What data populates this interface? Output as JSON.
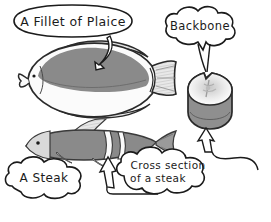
{
  "diagram": {
    "background_color": "#ffffff",
    "ink_color": "#1b1b1b",
    "body_gray": "#8a8a8a",
    "belly_white": "#fbfbfb",
    "fin_gray": "#c9c9c9",
    "shade_gray": "#9a9a9a"
  },
  "callouts": {
    "fillet": {
      "label": "A Fillet of Plaice",
      "shape": "oval"
    },
    "backbone": {
      "label": "Backbone",
      "shape": "cloud"
    },
    "steak": {
      "label": "A Steak",
      "shape": "cloud"
    },
    "cross_section": {
      "label_line1": "Cross section",
      "label_line2": "of a steak",
      "shape": "cloud"
    }
  },
  "illustrations": {
    "plaice": {
      "name": "Plaice flatfish",
      "fill": "#8a8a8a",
      "belly": "#fbfbfb"
    },
    "round_fish": {
      "name": "Round fish with steak section marked",
      "fill": "#8a8a8a"
    },
    "steak_cylinder": {
      "name": "Cylindrical steak cross section",
      "top_face": "#fdfdfd",
      "side_face": "#8f8f8f"
    }
  }
}
